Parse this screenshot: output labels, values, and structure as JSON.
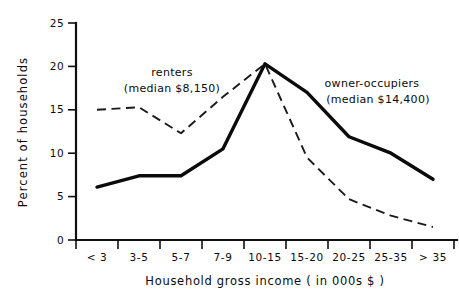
{
  "chart_data": {
    "type": "line",
    "title": "",
    "subtitle": "",
    "xlabel": "Household gross income ( in 000s $ )",
    "ylabel": "Percent of households",
    "categories": [
      "< 3",
      "3-5",
      "5-7",
      "7-9",
      "10-15",
      "15-20",
      "20-25",
      "25-35",
      "> 35"
    ],
    "ylim": [
      0,
      25
    ],
    "yticks": [
      0,
      5,
      10,
      15,
      20,
      25
    ],
    "ytick_labels": [
      "0",
      "5",
      "10",
      "15",
      "20",
      "25"
    ],
    "grid": false,
    "legend_position": "inline-annotations",
    "series": [
      {
        "name": "owner-occupiers",
        "style": "solid",
        "values": [
          6.1,
          7.4,
          7.4,
          10.5,
          20.3,
          17.0,
          11.9,
          10.0,
          7.0
        ]
      },
      {
        "name": "renters",
        "style": "dashed",
        "values": [
          15.0,
          15.3,
          12.3,
          16.5,
          20.3,
          9.5,
          4.7,
          2.8,
          1.5
        ]
      }
    ],
    "annotations": [
      {
        "name": "renters",
        "line1": "renters",
        "line2": "(median $8,150)"
      },
      {
        "name": "owner-occupiers",
        "line1": "owner-occupiers",
        "line2": "(median $14,400)"
      }
    ]
  }
}
